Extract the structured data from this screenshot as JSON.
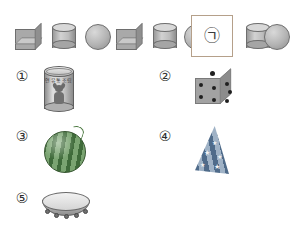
{
  "sequence": {
    "name": "shape-pattern-sequence",
    "items": [
      {
        "shape": "cube",
        "label": "cube"
      },
      {
        "shape": "cylinder",
        "label": "cylinder"
      },
      {
        "shape": "sphere",
        "label": "sphere"
      },
      {
        "shape": "cube",
        "label": "cube"
      },
      {
        "shape": "cylinder",
        "label": "cylinder"
      },
      {
        "shape": "sphere",
        "label": "sphere"
      },
      {
        "shape": "unknown",
        "label": "㉠"
      },
      {
        "shape": "cylinder",
        "label": "cylinder"
      },
      {
        "shape": "sphere",
        "label": "sphere"
      }
    ],
    "blank_marker": "㉠"
  },
  "choices": [
    {
      "number": "①",
      "object": "can",
      "solid": "cylinder",
      "label_text": "연유통조림"
    },
    {
      "number": "②",
      "object": "dice",
      "solid": "cube",
      "pips_top": "1",
      "pips_front": "4",
      "pips_right": "3"
    },
    {
      "number": "③",
      "object": "watermelon",
      "solid": "sphere"
    },
    {
      "number": "④",
      "object": "party-hat",
      "solid": "cone",
      "decoration": "★"
    },
    {
      "number": "⑤",
      "object": "tambourine",
      "solid": "cylinder"
    }
  ],
  "colors": {
    "background": "#ffffff",
    "shape_fill": "#b4b4b4",
    "shape_outline": "#6e6e6e",
    "box_border": "#b5a08a",
    "melon_dark": "#3f6b3a",
    "melon_light": "#7aa471",
    "cone_dark": "#4f6b8a",
    "cone_light": "#9fb2c6",
    "pip": "#1f1f1f"
  }
}
